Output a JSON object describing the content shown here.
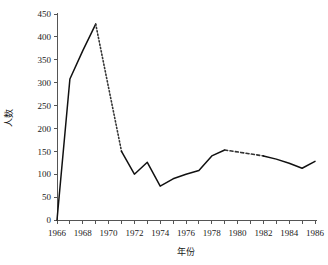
{
  "chart_data": {
    "type": "line",
    "title": "",
    "xlabel": "年份",
    "ylabel": "人数",
    "xlim": [
      1966,
      1986
    ],
    "ylim": [
      0,
      450
    ],
    "grid": false,
    "legend": "none",
    "y_ticks": [
      0,
      50,
      100,
      150,
      200,
      250,
      300,
      350,
      400,
      450
    ],
    "y_tick_labels": [
      "0",
      "50",
      "100",
      "150",
      "200",
      "250",
      "300",
      "350",
      "400",
      "450"
    ],
    "x_ticks": [
      1966,
      1967,
      1968,
      1969,
      1970,
      1971,
      1972,
      1973,
      1974,
      1975,
      1976,
      1977,
      1978,
      1979,
      1980,
      1981,
      1982,
      1983,
      1984,
      1985,
      1986
    ],
    "x_tick_labels": [
      "1966",
      "",
      "1968",
      "",
      "1970",
      "",
      "1972",
      "",
      "1974",
      "",
      "1976",
      "",
      "1978",
      "",
      "1980",
      "",
      "1982",
      "",
      "1984",
      "",
      "1986"
    ],
    "x_labeled_ticks": [
      1966,
      1968,
      1970,
      1972,
      1974,
      1976,
      1978,
      1980,
      1982,
      1984,
      1986
    ],
    "series": [
      {
        "name": "人数",
        "x": [
          1966,
          1967,
          1968,
          1969,
          1971,
          1972,
          1973,
          1974,
          1975,
          1976,
          1977,
          1978,
          1979,
          1982,
          1983,
          1984,
          1985,
          1986
        ],
        "values": [
          0,
          308,
          370,
          428,
          150,
          100,
          126,
          74,
          90,
          100,
          108,
          140,
          153,
          140,
          133,
          124,
          113,
          128
        ],
        "segment_styles": [
          {
            "from": 1966,
            "to": 1969,
            "style": "solid"
          },
          {
            "from": 1969,
            "to": 1971,
            "style": "dotted"
          },
          {
            "from": 1971,
            "to": 1979,
            "style": "solid"
          },
          {
            "from": 1979,
            "to": 1982,
            "style": "dashed"
          },
          {
            "from": 1982,
            "to": 1986,
            "style": "solid"
          }
        ]
      }
    ],
    "colors": {
      "line": "#111111",
      "axis": "#555555",
      "background": "#ffffff",
      "text": "#1a1a1a"
    }
  }
}
